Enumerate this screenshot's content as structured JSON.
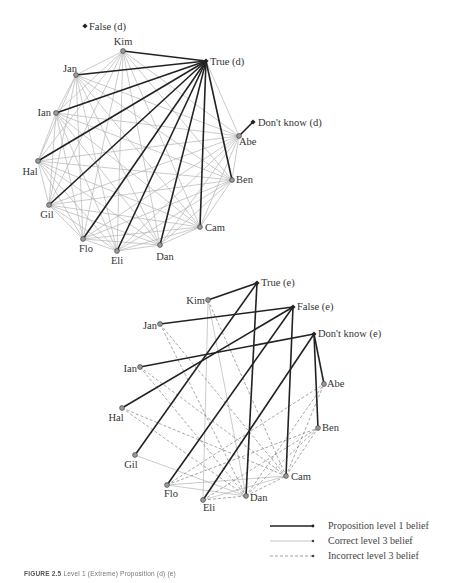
{
  "figure": {
    "caption_label": "FIGURE 2.5",
    "caption_text": "Level 1 (Extreme) Proposition (d) (e)"
  },
  "colors": {
    "thick": "#222222",
    "thin": "#b5b5b5",
    "dashed": "#8a8a8a",
    "node_fill": "#9a9a9a",
    "node_stroke": "#444444"
  },
  "legend": {
    "items": [
      {
        "key": "thick",
        "label": "Proposition level 1 belief"
      },
      {
        "key": "thin",
        "label": "Correct level 3 belief"
      },
      {
        "key": "dashed",
        "label": "Incorrect level 3 belief"
      }
    ]
  },
  "diagram_d": {
    "propositions": [
      {
        "id": "T",
        "label": "True (d)",
        "x": 206,
        "y": 61,
        "lx": 210,
        "ly": 65,
        "anchor": "start"
      },
      {
        "id": "F",
        "label": "False (d)",
        "x": 85,
        "y": 26,
        "lx": 89,
        "ly": 30,
        "anchor": "start"
      },
      {
        "id": "DK",
        "label": "Don't know (d)",
        "x": 253,
        "y": 122,
        "lx": 258,
        "ly": 126,
        "anchor": "start"
      }
    ],
    "agents": [
      {
        "id": "Kim",
        "label": "Kim",
        "x": 123,
        "y": 51,
        "lx": 123,
        "ly": 45,
        "anchor": "middle"
      },
      {
        "id": "Jan",
        "label": "Jan",
        "x": 76,
        "y": 75,
        "lx": 70,
        "ly": 72,
        "anchor": "middle"
      },
      {
        "id": "Ian",
        "label": "Ian",
        "x": 56,
        "y": 113,
        "lx": 51,
        "ly": 116,
        "anchor": "end"
      },
      {
        "id": "Hal",
        "label": "Hal",
        "x": 38,
        "y": 161,
        "lx": 30,
        "ly": 175,
        "anchor": "middle"
      },
      {
        "id": "Gil",
        "label": "Gil",
        "x": 49,
        "y": 205,
        "lx": 47,
        "ly": 218,
        "anchor": "middle"
      },
      {
        "id": "Flo",
        "label": "Flo",
        "x": 83,
        "y": 239,
        "lx": 86,
        "ly": 252,
        "anchor": "middle"
      },
      {
        "id": "Eli",
        "label": "Eli",
        "x": 117,
        "y": 251,
        "lx": 117,
        "ly": 264,
        "anchor": "middle"
      },
      {
        "id": "Dan",
        "label": "Dan",
        "x": 160,
        "y": 245,
        "lx": 165,
        "ly": 260,
        "anchor": "middle"
      },
      {
        "id": "Cam",
        "label": "Cam",
        "x": 200,
        "y": 227,
        "lx": 205,
        "ly": 231,
        "anchor": "start"
      },
      {
        "id": "Ben",
        "label": "Ben",
        "x": 232,
        "y": 180,
        "lx": 236,
        "ly": 183,
        "anchor": "start"
      },
      {
        "id": "Abe",
        "label": "Abe",
        "x": 239,
        "y": 136,
        "lx": 239,
        "ly": 145,
        "anchor": "start"
      }
    ],
    "thick_edges": [
      [
        "Kim",
        "T"
      ],
      [
        "Jan",
        "T"
      ],
      [
        "Ian",
        "T"
      ],
      [
        "Hal",
        "T"
      ],
      [
        "Gil",
        "T"
      ],
      [
        "Flo",
        "T"
      ],
      [
        "Eli",
        "T"
      ],
      [
        "Dan",
        "T"
      ],
      [
        "Cam",
        "T"
      ],
      [
        "Ben",
        "T"
      ],
      [
        "Abe",
        "DK"
      ]
    ],
    "thin_edges": "complete",
    "thin_extra": [
      [
        "Abe",
        "T"
      ]
    ],
    "dashed_edges": []
  },
  "diagram_e": {
    "propositions": [
      {
        "id": "T",
        "label": "True (e)",
        "x": 257,
        "y": 283,
        "lx": 261,
        "ly": 286,
        "anchor": "start"
      },
      {
        "id": "F",
        "label": "False (e)",
        "x": 293,
        "y": 307,
        "lx": 297,
        "ly": 310,
        "anchor": "start"
      },
      {
        "id": "DK",
        "label": "Don't know (e)",
        "x": 314,
        "y": 334,
        "lx": 318,
        "ly": 337,
        "anchor": "start"
      }
    ],
    "agents": [
      {
        "id": "Kim",
        "label": "Kim",
        "x": 208,
        "y": 300,
        "lx": 205,
        "ly": 304,
        "anchor": "end"
      },
      {
        "id": "Jan",
        "label": "Jan",
        "x": 160,
        "y": 324,
        "lx": 157,
        "ly": 329,
        "anchor": "end"
      },
      {
        "id": "Ian",
        "label": "Ian",
        "x": 140,
        "y": 367,
        "lx": 137,
        "ly": 372,
        "anchor": "end"
      },
      {
        "id": "Hal",
        "label": "Hal",
        "x": 122,
        "y": 408,
        "lx": 116,
        "ly": 421,
        "anchor": "middle"
      },
      {
        "id": "Gil",
        "label": "Gil",
        "x": 135,
        "y": 455,
        "lx": 131,
        "ly": 468,
        "anchor": "middle"
      },
      {
        "id": "Flo",
        "label": "Flo",
        "x": 167,
        "y": 485,
        "lx": 171,
        "ly": 497,
        "anchor": "middle"
      },
      {
        "id": "Eli",
        "label": "Eli",
        "x": 203,
        "y": 500,
        "lx": 209,
        "ly": 511,
        "anchor": "middle"
      },
      {
        "id": "Dan",
        "label": "Dan",
        "x": 246,
        "y": 496,
        "lx": 250,
        "ly": 501,
        "anchor": "start"
      },
      {
        "id": "Cam",
        "label": "Cam",
        "x": 286,
        "y": 476,
        "lx": 291,
        "ly": 480,
        "anchor": "start"
      },
      {
        "id": "Ben",
        "label": "Ben",
        "x": 318,
        "y": 428,
        "lx": 322,
        "ly": 431,
        "anchor": "start"
      },
      {
        "id": "Abe",
        "label": "Abe",
        "x": 324,
        "y": 384,
        "lx": 327,
        "ly": 387,
        "anchor": "start"
      }
    ],
    "thick_edges": [
      [
        "Kim",
        "T"
      ],
      [
        "Jan",
        "F"
      ],
      [
        "Ian",
        "DK"
      ],
      [
        "Hal",
        "F"
      ],
      [
        "Gil",
        "T"
      ],
      [
        "Flo",
        "F"
      ],
      [
        "Eli",
        "DK"
      ],
      [
        "Dan",
        "T"
      ],
      [
        "Cam",
        "F"
      ],
      [
        "Ben",
        "DK"
      ],
      [
        "Abe",
        "DK"
      ]
    ],
    "thin_edges": [
      [
        "Kim",
        "Eli"
      ],
      [
        "Gil",
        "Dan"
      ],
      [
        "Flo",
        "Cam"
      ],
      [
        "Flo",
        "Dan"
      ],
      [
        "Eli",
        "Cam"
      ],
      [
        "Kim",
        "Dan"
      ]
    ],
    "dashed_edges": [
      [
        "Jan",
        "Cam"
      ],
      [
        "Jan",
        "Dan"
      ],
      [
        "Ian",
        "Dan"
      ],
      [
        "Ian",
        "Cam"
      ],
      [
        "Hal",
        "Dan"
      ],
      [
        "Hal",
        "Cam"
      ],
      [
        "Kim",
        "Cam"
      ],
      [
        "Flo",
        "Ben"
      ],
      [
        "Flo",
        "Abe"
      ],
      [
        "Eli",
        "Dan"
      ],
      [
        "Eli",
        "Ben"
      ],
      [
        "Dan",
        "Abe"
      ],
      [
        "Dan",
        "Ben"
      ],
      [
        "Cam",
        "Abe"
      ],
      [
        "Cam",
        "Ben"
      ],
      [
        "Dan",
        "Cam"
      ]
    ]
  }
}
